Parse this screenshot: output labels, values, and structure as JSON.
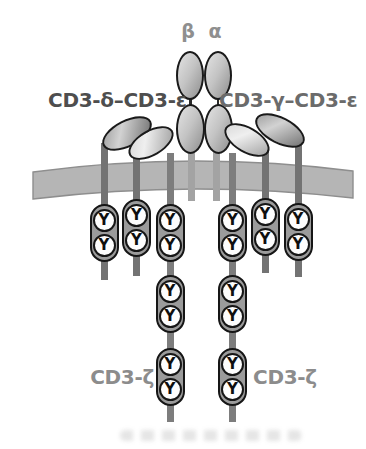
{
  "labels": {
    "beta": "β",
    "alpha": "α",
    "left_pair": "CD3-δ–CD3-ε",
    "right_pair": "CD3-γ–CD3-ε",
    "zeta_left": "CD3-ζ",
    "zeta_right": "CD3-ζ"
  },
  "glyphs": {
    "tyrosine": "Y"
  },
  "chains": [
    {
      "label": "CD3-δ",
      "tyrosines": 2
    },
    {
      "label": "CD3-ε (left)",
      "tyrosines": 2
    },
    {
      "label": "CD3-ζ (left)",
      "tyrosines": 6
    },
    {
      "label": "CD3-ζ (right)",
      "tyrosines": 6
    },
    {
      "label": "CD3-γ",
      "tyrosines": 2
    },
    {
      "label": "CD3-ε (right)",
      "tyrosines": 2
    },
    {
      "label": "TCR-β",
      "tyrosines": 0
    },
    {
      "label": "TCR-α",
      "tyrosines": 0
    }
  ],
  "colors": {
    "membrane": "#b5b5b5",
    "membrane_edge": "#8e8e8e",
    "capsule_fill": "#9b9b9b",
    "outline": "#1a1a1a",
    "stalk_dark": "#737373",
    "stalk_light": "#a3a3a3",
    "label_dark": "#4e4e4e",
    "label_gray": "#8c8c8c"
  }
}
